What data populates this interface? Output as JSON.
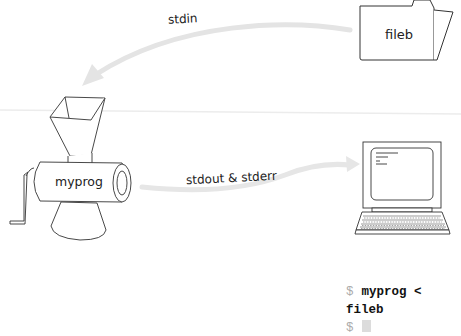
{
  "diagram": {
    "type": "stdin-stdout-redirection",
    "nodes": {
      "file": {
        "label": "fileb",
        "icon": "folder-icon"
      },
      "program": {
        "label": "myprog",
        "icon": "meat-grinder-icon"
      },
      "terminal_device": {
        "label": "",
        "icon": "computer-icon"
      }
    },
    "edges": [
      {
        "from": "fileb",
        "to": "myprog",
        "label": "stdin"
      },
      {
        "from": "myprog",
        "to": "computer",
        "label": "stdout & stderr"
      }
    ],
    "colors": {
      "arrow": "#e3e3e3",
      "line": "#333333",
      "divider": "#ececec",
      "prompt": "#aaaaaa"
    }
  },
  "terminal": {
    "lines": [
      {
        "prompt": "$",
        "command": "myprog < fileb"
      },
      {
        "prompt": "$",
        "command": ""
      }
    ]
  }
}
